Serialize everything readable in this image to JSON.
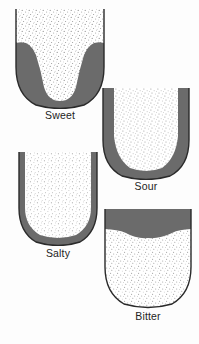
{
  "figure": {
    "background_color": "#fdfdfd",
    "ink_color": "#2a2a2a",
    "shade_color": "#6b6b6b",
    "stipple_color": "#8f8f8f",
    "panel_count": 4
  },
  "panels": [
    {
      "id": "sweet",
      "label": "Sweet",
      "region_description": "dark shading covers the lateral borders and the entire posterior/base of the tongue, leaving a pale stippled V-shaped wedge down the midline from the tip",
      "shaded_area": "sides-and-base",
      "stippled_area": "central-midline-wedge"
    },
    {
      "id": "sour",
      "label": "Sour",
      "region_description": "dark shading forms narrow bands along both lateral margins, curving around the rounded base, with the broad central surface left pale and stippled",
      "shaded_area": "lateral-margins",
      "stippled_area": "central-dorsum"
    },
    {
      "id": "salty",
      "label": "Salty",
      "region_description": "a thin dark rim follows the outer edge of the tongue from the anterolateral borders around the rounded tip, the remainder pale and stippled",
      "shaded_area": "outer-rim",
      "stippled_area": "body-of-tongue"
    },
    {
      "id": "bitter",
      "label": "Bitter",
      "region_description": "a broad dark band spans the posterior third across the back of the tongue with a wavy inferior boundary, the rest pale and stippled",
      "shaded_area": "posterior-band",
      "stippled_area": "anterior-two-thirds"
    }
  ],
  "colors": {
    "shade": "#6b6b6b",
    "outline": "#2a2a2a",
    "paper": "#fdfdfd",
    "text": "#232323"
  }
}
